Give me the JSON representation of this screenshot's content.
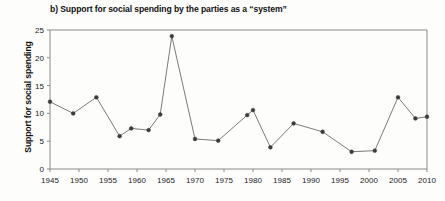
{
  "chart_data": {
    "type": "line",
    "title": "b) Support for social spending by the parties as a “system”",
    "xlabel": "",
    "ylabel": "Support for social spending",
    "xlim": [
      1945,
      2010
    ],
    "ylim": [
      0,
      25
    ],
    "grid": false,
    "legend": "none",
    "xticks": [
      1945,
      1950,
      1955,
      1960,
      1965,
      1970,
      1975,
      1980,
      1985,
      1990,
      1995,
      2000,
      2005,
      2010
    ],
    "yticks": [
      0,
      5,
      10,
      15,
      20,
      25
    ],
    "x": [
      1945,
      1949,
      1953,
      1957,
      1959,
      1962,
      1964,
      1966,
      1970,
      1974,
      1979,
      1980,
      1983,
      1987,
      1992,
      1997,
      2001,
      2005,
      2008,
      2010
    ],
    "values": [
      12.1,
      10.0,
      12.9,
      5.9,
      7.3,
      7.0,
      9.8,
      23.9,
      5.4,
      5.1,
      9.7,
      10.6,
      3.9,
      8.2,
      6.7,
      3.1,
      3.3,
      12.9,
      9.1,
      9.4
    ],
    "series": [
      {
        "name": "Support for social spending",
        "points": [
          {
            "x": 1945,
            "y": 12.1
          },
          {
            "x": 1949,
            "y": 10.0
          },
          {
            "x": 1953,
            "y": 12.9
          },
          {
            "x": 1957,
            "y": 5.9
          },
          {
            "x": 1959,
            "y": 7.3
          },
          {
            "x": 1962,
            "y": 7.0
          },
          {
            "x": 1964,
            "y": 9.8
          },
          {
            "x": 1966,
            "y": 23.9
          },
          {
            "x": 1970,
            "y": 5.4
          },
          {
            "x": 1974,
            "y": 5.1
          },
          {
            "x": 1979,
            "y": 9.7
          },
          {
            "x": 1980,
            "y": 10.6
          },
          {
            "x": 1983,
            "y": 3.9
          },
          {
            "x": 1987,
            "y": 8.2
          },
          {
            "x": 1992,
            "y": 6.7
          },
          {
            "x": 1997,
            "y": 3.1
          },
          {
            "x": 2001,
            "y": 3.3
          },
          {
            "x": 2005,
            "y": 12.9
          },
          {
            "x": 2008,
            "y": 9.1
          },
          {
            "x": 2010,
            "y": 9.4
          }
        ]
      }
    ],
    "colors": {
      "line": "#6b6b6b",
      "marker": "#3c3c3c",
      "axis": "#8a8a8a",
      "text": "#111111",
      "background": "#fdfdfc"
    }
  }
}
